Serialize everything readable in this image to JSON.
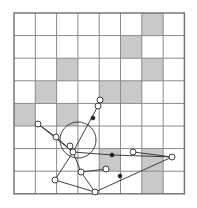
{
  "figure": {
    "type": "diagram",
    "background_color": "#ffffff"
  },
  "grid": {
    "columns": 8,
    "rows": 8,
    "origin_x": 14,
    "origin_y": 13,
    "cell_width": 21.3,
    "cell_height": 22.6,
    "line_color": "#8a8a8a",
    "line_width": 1,
    "border_color": "#6e6e6e",
    "border_width": 1.4,
    "shaded_fill": "#c9c9c9",
    "empty_fill": "#ffffff",
    "shaded_cells": [
      {
        "col": 7,
        "row": 1
      },
      {
        "col": 6,
        "row": 2
      },
      {
        "col": 3,
        "row": 3
      },
      {
        "col": 7,
        "row": 3
      },
      {
        "col": 2,
        "row": 4
      },
      {
        "col": 5,
        "row": 4
      },
      {
        "col": 6,
        "row": 4
      },
      {
        "col": 1,
        "row": 5
      },
      {
        "col": 3,
        "row": 5
      },
      {
        "col": 5,
        "row": 7
      },
      {
        "col": 7,
        "row": 7
      },
      {
        "col": 7,
        "row": 8
      }
    ]
  },
  "linkage": {
    "stroke_color": "#2b2b2b",
    "stroke_width": 0.9,
    "joint_stroke": "#2b2b2b",
    "joint_fill": "#ffffff",
    "joint_radius": 3.0,
    "solid_joint_fill": "#1a1a1a",
    "solid_joint_radius": 2.0,
    "hub": {
      "x": 73,
      "y": 152,
      "label": "central-hub"
    },
    "coupler_circle": {
      "cx": 78,
      "cy": 140,
      "r": 18,
      "label": "coupler-circle"
    },
    "joints": [
      {
        "id": "j-left-outer",
        "x": 38,
        "y": 124,
        "type": "open"
      },
      {
        "id": "j-left-mid",
        "x": 56,
        "y": 137,
        "type": "open"
      },
      {
        "id": "j-hub",
        "x": 73,
        "y": 152,
        "type": "open"
      },
      {
        "id": "j-hub-upper",
        "x": 70,
        "y": 146,
        "type": "open"
      },
      {
        "id": "j-upper-arm",
        "x": 98,
        "y": 106,
        "type": "open"
      },
      {
        "id": "j-upper-tip",
        "x": 100,
        "y": 100,
        "type": "open"
      },
      {
        "id": "j-upper-solid",
        "x": 93,
        "y": 118,
        "type": "solid"
      },
      {
        "id": "j-lower-left",
        "x": 55,
        "y": 180,
        "type": "open"
      },
      {
        "id": "j-lower-mid",
        "x": 81,
        "y": 172,
        "type": "open"
      },
      {
        "id": "j-lower-bottom",
        "x": 95,
        "y": 192,
        "type": "open"
      },
      {
        "id": "j-right-low",
        "x": 106,
        "y": 169,
        "type": "open"
      },
      {
        "id": "j-right-mid",
        "x": 112,
        "y": 155,
        "type": "solid"
      },
      {
        "id": "j-right-upper",
        "x": 133,
        "y": 152,
        "type": "open"
      },
      {
        "id": "j-right-far",
        "x": 172,
        "y": 157,
        "type": "open"
      },
      {
        "id": "j-diag-solid",
        "x": 120,
        "y": 176,
        "type": "solid"
      }
    ],
    "links": [
      {
        "id": "link-left-outer",
        "from": "j-left-outer",
        "to": "j-hub"
      },
      {
        "id": "link-left-mid",
        "from": "j-left-mid",
        "to": "j-hub"
      },
      {
        "id": "link-left-chain",
        "from": "j-left-outer",
        "to": "j-left-mid"
      },
      {
        "id": "link-upper-arm",
        "from": "j-hub",
        "to": "j-upper-arm"
      },
      {
        "id": "link-upper-tip",
        "from": "j-upper-arm",
        "to": "j-upper-tip"
      },
      {
        "id": "link-hub-lower-left",
        "from": "j-hub",
        "to": "j-lower-left"
      },
      {
        "id": "link-hub-lower-mid",
        "from": "j-hub",
        "to": "j-lower-mid"
      },
      {
        "id": "link-lower-chain",
        "from": "j-lower-left",
        "to": "j-lower-bottom"
      },
      {
        "id": "link-lower-bottom",
        "from": "j-lower-mid",
        "to": "j-lower-bottom"
      },
      {
        "id": "link-lower-right",
        "from": "j-lower-mid",
        "to": "j-right-low"
      },
      {
        "id": "link-hub-right",
        "from": "j-hub",
        "to": "j-right-mid"
      },
      {
        "id": "link-right-span",
        "from": "j-right-mid",
        "to": "j-right-far"
      },
      {
        "id": "link-right-upper",
        "from": "j-right-upper",
        "to": "j-right-far"
      },
      {
        "id": "link-diag-long",
        "from": "j-lower-bottom",
        "to": "j-right-far"
      }
    ]
  }
}
